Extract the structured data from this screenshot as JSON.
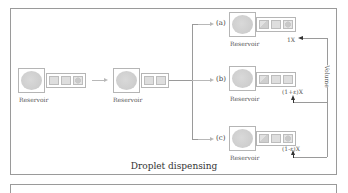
{
  "diagram": {
    "caption": "Droplet dispensing",
    "stages": [
      {
        "label": "Reservoir"
      },
      {
        "label": "Reservoir"
      }
    ],
    "branches": [
      {
        "tag": "(a)",
        "reservoir_label": "Reservoir",
        "volume_label": "1X"
      },
      {
        "tag": "(b)",
        "reservoir_label": "Reservoir",
        "volume_label": "(1+ε)X"
      },
      {
        "tag": "(c)",
        "reservoir_label": "Reservoir",
        "volume_label": "(1-ε)X"
      }
    ],
    "volume_axis_label": "Volume"
  },
  "colors": {
    "frame": "#9a9a9a",
    "droplet_fill": "#d0d0d0",
    "arrow_light": "#b8b8b8",
    "arrow_dark": "#333333"
  }
}
